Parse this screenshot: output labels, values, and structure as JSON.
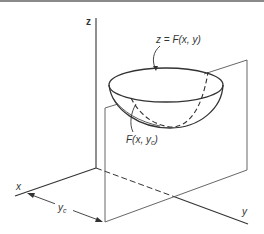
{
  "diagram": {
    "axes": {
      "z_label": "z",
      "x_label": "x",
      "y_label": "y"
    },
    "surface_label": "z = F(x, y)",
    "section_label_prefix": "F(x, y",
    "section_label_sub": "c",
    "section_label_suffix": ")",
    "distance_label": "y",
    "distance_label_sub": "c",
    "colors": {
      "line": "#333333",
      "plane": "#555555",
      "background": "#ffffff"
    }
  }
}
